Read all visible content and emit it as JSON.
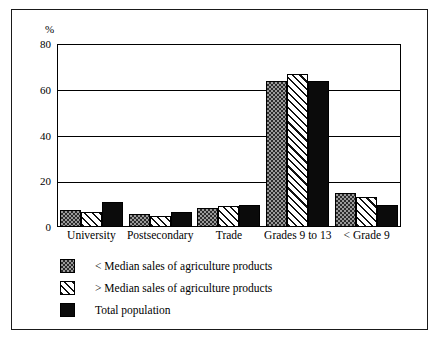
{
  "chart_data": {
    "type": "bar",
    "title": "",
    "subtitle": "",
    "xlabel": "",
    "ylabel": "%",
    "ylim": [
      0,
      80
    ],
    "yticks": [
      0,
      20,
      40,
      60,
      80
    ],
    "grid": true,
    "legend_position": "below",
    "categories": [
      "University",
      "Postsecondary",
      "Trade",
      "Grades 9 to 13",
      "< Grade 9"
    ],
    "series": [
      {
        "name": "< Median sales of agriculture products",
        "pattern": "dotted-gray",
        "values": [
          7.5,
          5.5,
          8.5,
          64,
          15
        ]
      },
      {
        "name": "> Median sales of agriculture products",
        "pattern": "diagonal-hatch",
        "values": [
          6.5,
          5,
          9,
          67,
          13
        ]
      },
      {
        "name": "Total population",
        "pattern": "solid-black",
        "values": [
          11,
          6.5,
          9.8,
          64,
          9.5
        ]
      }
    ]
  },
  "axis": {
    "unit_label": "%",
    "tick_labels": [
      "80",
      "60",
      "40",
      "20",
      "0"
    ]
  },
  "colors": {
    "frame": "#1a1a1a",
    "axis": "#000000",
    "series_dotted": "#9a9a9a",
    "series_hatch": "#ffffff",
    "series_solid": "#0b0b0b",
    "background": "#ffffff"
  }
}
